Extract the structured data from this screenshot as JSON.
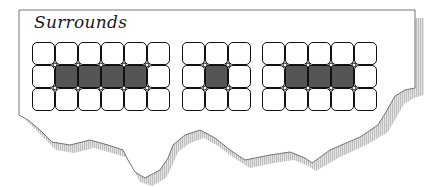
{
  "title": "Surrounds",
  "colors": {
    "paper": "#ffffff",
    "outline": "#555555",
    "shadow": "#c8c8c8",
    "cell_border": "#111111",
    "cell_filled": "#555555",
    "cell_empty": "#ffffff"
  },
  "grids": [
    {
      "name": "grid-1",
      "left": 32,
      "cols": 6,
      "rows": 3,
      "filled": [
        [
          1,
          1
        ],
        [
          1,
          2
        ],
        [
          1,
          3
        ],
        [
          1,
          4
        ]
      ]
    },
    {
      "name": "grid-2",
      "left": 182,
      "cols": 3,
      "rows": 3,
      "filled": [
        [
          1,
          1
        ]
      ]
    },
    {
      "name": "grid-3",
      "left": 262,
      "cols": 5,
      "rows": 3,
      "filled": [
        [
          1,
          1
        ],
        [
          1,
          2
        ],
        [
          1,
          3
        ]
      ]
    }
  ]
}
